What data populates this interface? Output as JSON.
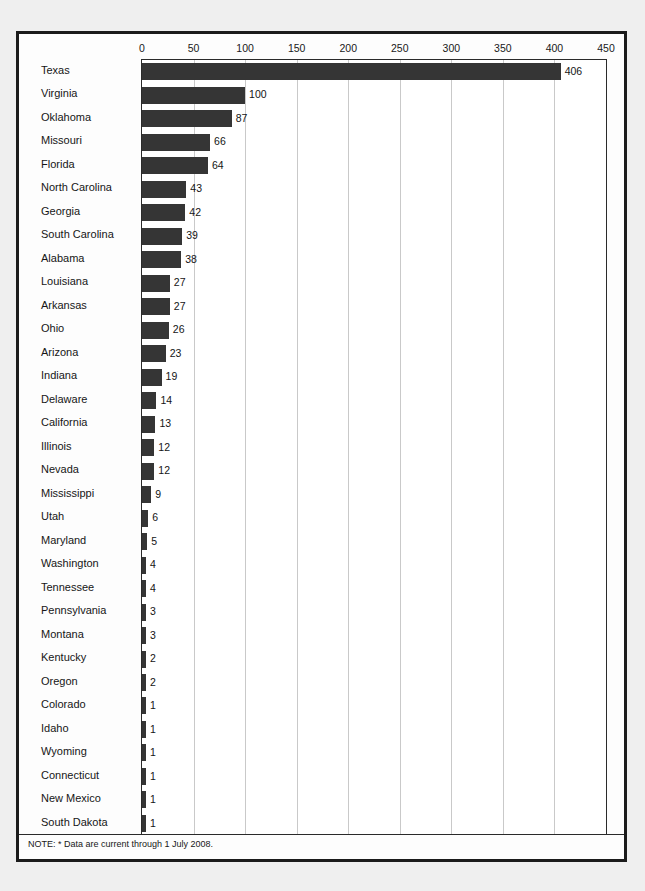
{
  "figure": {
    "note": "NOTE: * Data are current through 1 July 2008.",
    "bar_color": "#353535",
    "grid_color": "#c9c9c9",
    "frame_color": "#1b1b1b",
    "page_background": "#efefef"
  },
  "chart_data": {
    "type": "bar",
    "orientation": "horizontal",
    "title": "",
    "subtitle": "",
    "xlabel": "",
    "ylabel": "",
    "xlim": [
      0,
      450
    ],
    "ylim": null,
    "grid": true,
    "legend": null,
    "legend_position": "none",
    "axis_position": "top",
    "xticks": [
      0,
      50,
      100,
      150,
      200,
      250,
      300,
      350,
      400,
      450
    ],
    "xtick_labels": [
      "0",
      "50",
      "100",
      "150",
      "200",
      "250",
      "300",
      "350",
      "400",
      "450"
    ],
    "data_labels": true,
    "annotations": [
      "NOTE: * Data are current through 1 July 2008."
    ],
    "categories": [
      "Texas",
      "Virginia",
      "Oklahoma",
      "Missouri",
      "Florida",
      "North Carolina",
      "Georgia",
      "South Carolina",
      "Alabama",
      "Louisiana",
      "Arkansas",
      "Ohio",
      "Arizona",
      "Indiana",
      "Delaware",
      "California",
      "Illinois",
      "Nevada",
      "Mississippi",
      "Utah",
      "Maryland",
      "Washington",
      "Tennessee",
      "Pennsylvania",
      "Montana",
      "Kentucky",
      "Oregon",
      "Colorado",
      "Idaho",
      "Wyoming",
      "Connecticut",
      "New Mexico",
      "South Dakota"
    ],
    "values": [
      406,
      100,
      87,
      66,
      64,
      43,
      42,
      39,
      38,
      27,
      27,
      26,
      23,
      19,
      14,
      13,
      12,
      12,
      9,
      6,
      5,
      4,
      4,
      3,
      3,
      2,
      2,
      1,
      1,
      1,
      1,
      1,
      1
    ],
    "value_labels": [
      "406",
      "100",
      "87",
      "66",
      "64",
      "43",
      "42",
      "39",
      "38",
      "27",
      "27",
      "26",
      "23",
      "19",
      "14",
      "13",
      "12",
      "12",
      "9",
      "6",
      "5",
      "4",
      "4",
      "3",
      "3",
      "2",
      "2",
      "1",
      "1",
      "1",
      "1",
      "1",
      "1"
    ]
  }
}
